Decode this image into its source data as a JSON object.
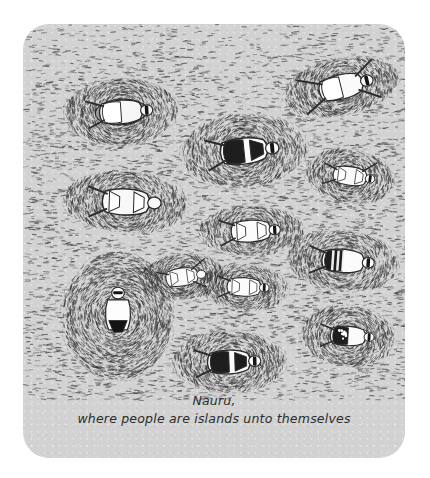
{
  "artwork": {
    "title": "Nauru cartoon",
    "caption_line_1": "Nauru,",
    "caption_line_2": "where people are islands unto themselves",
    "medium": "pen-and-ink cartoon on gray card",
    "background_color": "#d2d2d2",
    "frame_color": "#ffffff",
    "ink_color": "#2b2b2b",
    "card": {
      "x": 23,
      "y": 24,
      "width": 382,
      "height": 434,
      "corner_radius": 26
    }
  },
  "scene": {
    "description": "A gray sea rendered as dense short dashes, dotted with tiny islands; each island holds one sunbathing figure.",
    "sea_label": "stippled sea texture",
    "island_count": 12,
    "islands": [
      {
        "id": "island-1",
        "label": "figure on gray beach towel",
        "cx": 98,
        "cy": 88,
        "rx": 56,
        "ry": 33,
        "angle": -4,
        "figure": {
          "pose": "lying-on-back",
          "swimsuit": "white-bikini",
          "towel": "#9b9b9b",
          "has_sunglasses": true,
          "skin": "#f6f6f6"
        }
      },
      {
        "id": "island-2",
        "label": "small island with tiny sunbather",
        "cx": 103,
        "cy": 178,
        "rx": 62,
        "ry": 30,
        "angle": 2,
        "figure": {
          "pose": "lying-on-back",
          "swimsuit": "white",
          "towel": null,
          "has_sunglasses": false,
          "skin": "#f8f8f8"
        }
      },
      {
        "id": "island-3",
        "label": "figure in dark bikini",
        "cx": 221,
        "cy": 127,
        "rx": 62,
        "ry": 36,
        "angle": -6,
        "figure": {
          "pose": "lying-on-side",
          "swimsuit": "black-bikini",
          "towel": null,
          "has_sunglasses": true,
          "skin": "#fbfbfb"
        }
      },
      {
        "id": "island-4",
        "label": "spread-eagle sunbather top right",
        "cx": 318,
        "cy": 63,
        "rx": 58,
        "ry": 28,
        "angle": -14,
        "figure": {
          "pose": "arms-and-legs-spread",
          "swimsuit": "white-bikini",
          "towel": null,
          "has_sunglasses": true,
          "skin": "#fafafa"
        }
      },
      {
        "id": "island-5",
        "label": "figure with raised arm right side",
        "cx": 327,
        "cy": 152,
        "rx": 44,
        "ry": 26,
        "angle": 8,
        "figure": {
          "pose": "arm-raised",
          "swimsuit": "white",
          "towel": null,
          "has_sunglasses": true,
          "skin": "#fafafa"
        }
      },
      {
        "id": "island-6",
        "label": "center sunbather",
        "cx": 228,
        "cy": 207,
        "rx": 52,
        "ry": 24,
        "angle": -3,
        "figure": {
          "pose": "lying-on-back",
          "swimsuit": "white",
          "towel": null,
          "has_sunglasses": true,
          "skin": "#fbfbfb"
        }
      },
      {
        "id": "island-7",
        "label": "figure in striped black swimsuit",
        "cx": 320,
        "cy": 237,
        "rx": 55,
        "ry": 30,
        "angle": 4,
        "figure": {
          "pose": "lying-on-back",
          "swimsuit": "black-and-white-stripes",
          "towel": null,
          "has_sunglasses": true,
          "skin": "#fbfbfb"
        }
      },
      {
        "id": "island-8",
        "label": "figure with outstretched arms",
        "cx": 159,
        "cy": 253,
        "rx": 42,
        "ry": 22,
        "angle": -8,
        "figure": {
          "pose": "arms-outstretched",
          "swimsuit": "white",
          "towel": null,
          "has_sunglasses": false,
          "skin": "#fbfbfb"
        }
      },
      {
        "id": "island-9",
        "label": "figure lying horizontally",
        "cx": 221,
        "cy": 263,
        "rx": 44,
        "ry": 22,
        "angle": 2,
        "figure": {
          "pose": "lying-on-back",
          "swimsuit": "white",
          "towel": null,
          "has_sunglasses": true,
          "skin": "#fbfbfb"
        }
      },
      {
        "id": "island-10",
        "label": "large island with upright bather in black briefs",
        "cx": 95,
        "cy": 292,
        "rx": 55,
        "ry": 64,
        "angle": 0,
        "figure": {
          "pose": "seated-upright",
          "swimsuit": "black-briefs",
          "towel": null,
          "has_sunglasses": true,
          "skin": "#fdfdfd"
        }
      },
      {
        "id": "island-11",
        "label": "bottom-center figure in black-and-white suit",
        "cx": 206,
        "cy": 338,
        "rx": 56,
        "ry": 30,
        "angle": -2,
        "figure": {
          "pose": "lying-on-back",
          "swimsuit": "black-and-white",
          "towel": null,
          "has_sunglasses": true,
          "skin": "#fbfbfb"
        }
      },
      {
        "id": "island-12",
        "label": "figure in black polka-dot suit",
        "cx": 325,
        "cy": 312,
        "rx": 46,
        "ry": 30,
        "angle": 3,
        "figure": {
          "pose": "lying-on-back",
          "swimsuit": "black-polka-dot",
          "towel": null,
          "has_sunglasses": true,
          "skin": "#fbfbfb"
        }
      }
    ]
  }
}
